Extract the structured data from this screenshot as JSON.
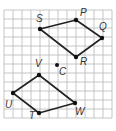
{
  "diagram": {
    "type": "coordinate-grid-transformation",
    "grid": {
      "x0": 4,
      "y0": 10,
      "cell": 9,
      "cols": 12,
      "rows": 12,
      "line_color": "#b8b8b8"
    },
    "colors": {
      "line": "#222222",
      "point": "#111111",
      "label": "#333333"
    },
    "center": {
      "name": "C",
      "x": 57,
      "y": 65,
      "label_dx": 2,
      "label_dy": 10
    },
    "polygons": [
      {
        "name": "SPQR",
        "vertices": [
          {
            "name": "S",
            "x": 40,
            "y": 29,
            "label_dx": -4,
            "label_dy": -7
          },
          {
            "name": "P",
            "x": 76,
            "y": 20,
            "label_dx": 4,
            "label_dy": -4
          },
          {
            "name": "Q",
            "x": 102,
            "y": 38,
            "label_dx": -3,
            "label_dy": -8
          },
          {
            "name": "R",
            "x": 76,
            "y": 57,
            "label_dx": 4,
            "label_dy": 8
          }
        ]
      },
      {
        "name": "VWTU",
        "vertices": [
          {
            "name": "V",
            "x": 39,
            "y": 75,
            "label_dx": -4,
            "label_dy": -8
          },
          {
            "name": "W",
            "x": 75,
            "y": 103,
            "label_dx": 0,
            "label_dy": 12
          },
          {
            "name": "T",
            "x": 39,
            "y": 113,
            "label_dx": -10,
            "label_dy": 6
          },
          {
            "name": "U",
            "x": 13,
            "y": 93,
            "label_dx": -8,
            "label_dy": 15
          }
        ]
      }
    ]
  }
}
